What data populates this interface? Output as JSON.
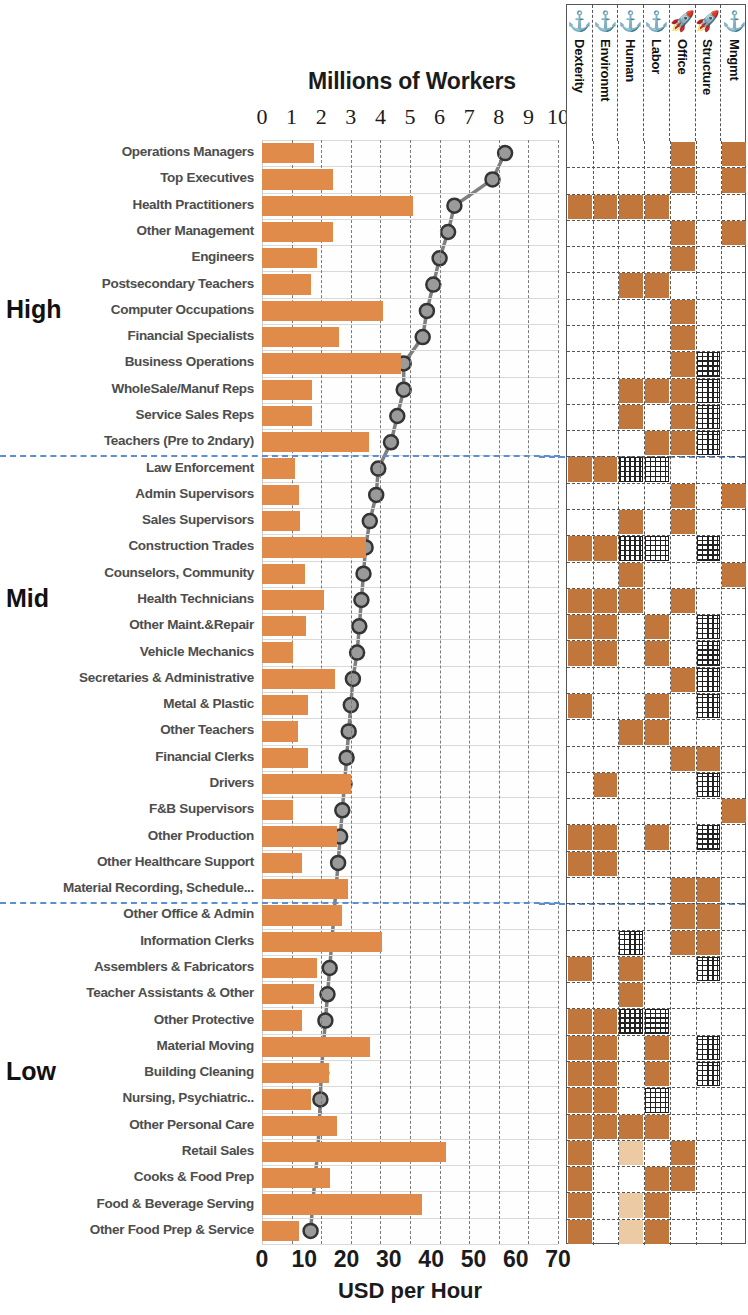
{
  "chart_data": {
    "type": "bar",
    "title": "Millions of Workers",
    "xlabel_top": "Millions of Workers",
    "xlabel_bottom": "USD per Hour",
    "grid": true,
    "legend_position": "none",
    "top_axis": {
      "label": "Millions of Workers",
      "ticks": [
        0,
        1,
        2,
        3,
        4,
        5,
        6,
        7,
        8,
        9,
        10
      ],
      "range": [
        0,
        10
      ]
    },
    "bottom_axis": {
      "label": "USD per Hour",
      "ticks": [
        0,
        10,
        20,
        30,
        40,
        50,
        60,
        70
      ],
      "range": [
        0,
        70
      ]
    },
    "series": [
      {
        "name": "Millions of Workers",
        "type": "bar",
        "axis": "top",
        "color": "#e08b49"
      },
      {
        "name": "USD per Hour",
        "type": "line",
        "axis": "bottom",
        "color": "#7f7f7f"
      }
    ],
    "group_labels": [
      "High",
      "Mid",
      "Low"
    ],
    "categories": [
      "Operations Managers",
      "Top Executives",
      "Health Practitioners",
      "Other Management",
      "Engineers",
      "Postsecondary Teachers",
      "Computer Occupations",
      "Financial Specialists",
      "Business Operations",
      "WholeSale/Manuf Reps",
      "Service Sales Reps",
      "Teachers (Pre to 2ndary)",
      "Law Enforcement",
      "Admin Supervisors",
      "Sales Supervisors",
      "Construction Trades",
      "Counselors, Community",
      "Health Technicians",
      "Other Maint.&Repair",
      "Vehicle Mechanics",
      "Secretaries & Administrative",
      "Metal & Plastic",
      "Other Teachers",
      "Financial Clerks",
      "Drivers",
      "F&B Supervisors",
      "Other Production",
      "Other Healthcare Support",
      "Material Recording, Schedule...",
      "Other Office & Admin",
      "Information Clerks",
      "Assemblers & Fabricators",
      "Teacher Assistants & Other",
      "Other Protective",
      "Material Moving",
      "Building Cleaning",
      "Nursing, Psychiatric..",
      "Other Personal  Care",
      "Retail Sales",
      "Cooks & Food Prep",
      "Food & Beverage Serving",
      "Other Food  Prep & Service"
    ],
    "workers_millions": [
      1.75,
      2.4,
      5.1,
      2.4,
      1.85,
      1.65,
      4.1,
      2.6,
      4.7,
      1.7,
      1.7,
      3.6,
      1.1,
      1.25,
      1.3,
      3.5,
      1.45,
      2.1,
      1.5,
      1.05,
      2.45,
      1.55,
      1.2,
      1.55,
      3.0,
      1.05,
      2.55,
      1.35,
      2.9,
      2.7,
      4.05,
      1.85,
      1.75,
      1.35,
      3.65,
      2.25,
      1.65,
      2.55,
      6.2,
      2.3,
      5.4,
      1.25
    ],
    "usd_per_hour": [
      57.5,
      54.5,
      45.5,
      44.0,
      42.0,
      40.5,
      39.0,
      38.0,
      33.5,
      33.5,
      32.0,
      30.5,
      27.5,
      27.0,
      25.5,
      24.5,
      24.0,
      23.5,
      23.0,
      22.5,
      21.5,
      21.0,
      20.5,
      20.0,
      19.5,
      19.0,
      18.5,
      18.0,
      17.5,
      17.0,
      16.5,
      16.0,
      15.5,
      15.0,
      14.5,
      14.0,
      13.8,
      13.5,
      13.2,
      12.5,
      12.0,
      11.5
    ],
    "matrix": {
      "columns": [
        {
          "label": "Dexterity",
          "icon": "anchor-icon"
        },
        {
          "label": "Environmt",
          "icon": "anchor-icon"
        },
        {
          "label": "Human",
          "icon": "anchor-icon"
        },
        {
          "label": "Labor",
          "icon": "anchor-icon"
        },
        {
          "label": "Office",
          "icon": "rocket-icon"
        },
        {
          "label": "Structure",
          "icon": "rocket-icon"
        },
        {
          "label": "Mngmt",
          "icon": "anchor-icon"
        }
      ],
      "legend": {
        "fill": "#c1773c",
        "hatch": "cross-hatch",
        "empty": "#ffffff"
      },
      "rows": [
        [
          "",
          "",
          "",
          "",
          "fill",
          "",
          "fill"
        ],
        [
          "",
          "",
          "",
          "",
          "fill",
          "",
          "fill"
        ],
        [
          "fill",
          "fill",
          "fill",
          "fill",
          "",
          "",
          ""
        ],
        [
          "",
          "",
          "",
          "",
          "fill",
          "",
          "fill"
        ],
        [
          "",
          "",
          "",
          "",
          "fill",
          "",
          ""
        ],
        [
          "",
          "",
          "fill",
          "fill",
          "",
          "",
          ""
        ],
        [
          "",
          "",
          "",
          "",
          "fill",
          "",
          ""
        ],
        [
          "",
          "",
          "",
          "",
          "fill",
          "",
          ""
        ],
        [
          "",
          "",
          "",
          "",
          "fill",
          "hatch",
          ""
        ],
        [
          "",
          "",
          "fill",
          "fill",
          "fill",
          "hatch",
          ""
        ],
        [
          "",
          "",
          "fill",
          "",
          "fill",
          "hatch",
          ""
        ],
        [
          "",
          "",
          "",
          "fill",
          "fill",
          "hatch",
          ""
        ],
        [
          "fill",
          "fill",
          "hatch",
          "hatch",
          "",
          "",
          ""
        ],
        [
          "",
          "",
          "",
          "",
          "fill",
          "",
          "fill"
        ],
        [
          "",
          "",
          "fill",
          "",
          "fill",
          "",
          ""
        ],
        [
          "fill",
          "fill",
          "hatch",
          "hatch",
          "",
          "hatch",
          ""
        ],
        [
          "",
          "",
          "fill",
          "",
          "",
          "",
          "fill"
        ],
        [
          "fill",
          "fill",
          "fill",
          "",
          "fill",
          "",
          ""
        ],
        [
          "fill",
          "fill",
          "",
          "fill",
          "",
          "hatch",
          ""
        ],
        [
          "fill",
          "fill",
          "",
          "fill",
          "",
          "hatch",
          ""
        ],
        [
          "",
          "",
          "",
          "",
          "fill",
          "hatch",
          ""
        ],
        [
          "fill",
          "",
          "",
          "fill",
          "",
          "hatch",
          ""
        ],
        [
          "",
          "",
          "fill",
          "fill",
          "",
          "",
          ""
        ],
        [
          "",
          "",
          "",
          "",
          "fill",
          "fill",
          ""
        ],
        [
          "",
          "fill",
          "",
          "",
          "",
          "hatch",
          ""
        ],
        [
          "",
          "",
          "",
          "",
          "",
          "",
          "fill"
        ],
        [
          "fill",
          "fill",
          "",
          "fill",
          "",
          "hatch",
          ""
        ],
        [
          "fill",
          "fill",
          "",
          "",
          "",
          "",
          ""
        ],
        [
          "",
          "",
          "",
          "",
          "fill",
          "fill",
          ""
        ],
        [
          "",
          "",
          "",
          "",
          "fill",
          "fill",
          ""
        ],
        [
          "",
          "",
          "hatch",
          "",
          "fill",
          "fill",
          ""
        ],
        [
          "fill",
          "",
          "fill",
          "",
          "",
          "hatch",
          ""
        ],
        [
          "",
          "",
          "fill",
          "",
          "",
          "",
          ""
        ],
        [
          "fill",
          "fill",
          "hatch",
          "hatch",
          "",
          "",
          ""
        ],
        [
          "fill",
          "fill",
          "",
          "fill",
          "",
          "hatch",
          ""
        ],
        [
          "fill",
          "fill",
          "",
          "fill",
          "",
          "hatch",
          ""
        ],
        [
          "fill",
          "fill",
          "",
          "hatch",
          "",
          "",
          ""
        ],
        [
          "fill",
          "fill",
          "fill",
          "fill",
          "",
          "",
          ""
        ],
        [
          "fill",
          "",
          "fill-light",
          "",
          "fill",
          "",
          ""
        ],
        [
          "fill",
          "",
          "",
          "fill",
          "fill",
          "",
          ""
        ],
        [
          "fill",
          "",
          "fill-light",
          "fill",
          "",
          "",
          ""
        ],
        [
          "fill",
          "",
          "fill-light",
          "fill",
          "",
          "",
          ""
        ]
      ]
    }
  }
}
